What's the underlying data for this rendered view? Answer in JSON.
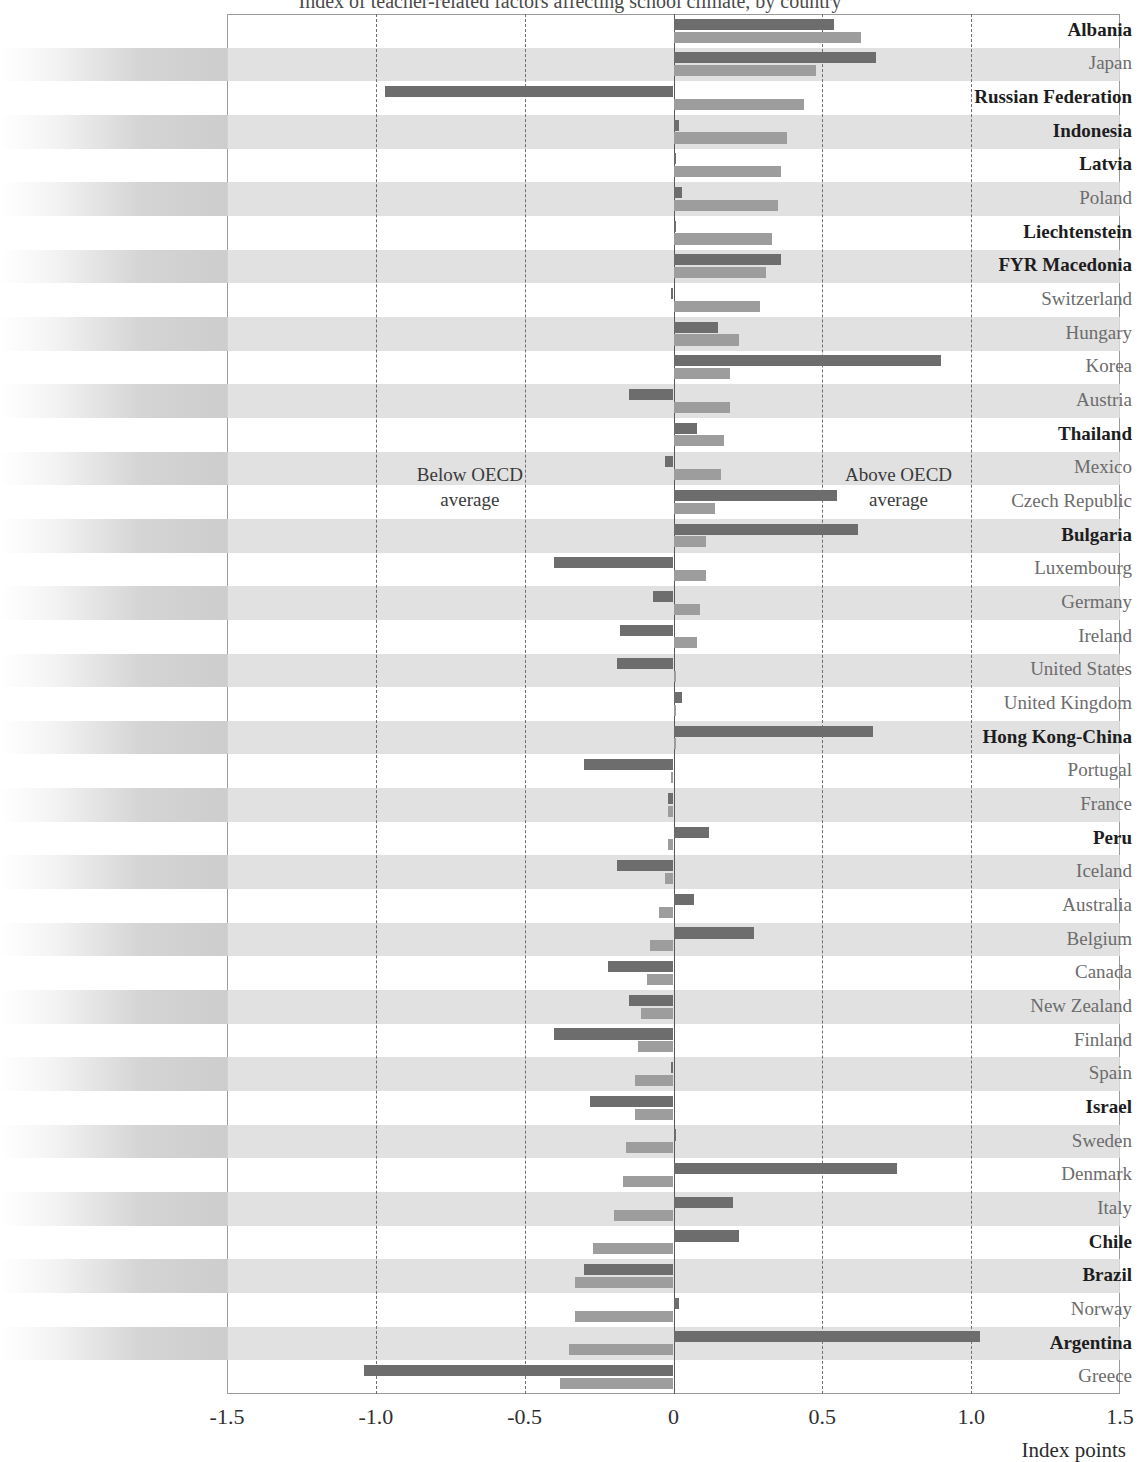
{
  "axis": {
    "label": "Index points",
    "ticks": [
      "-1.5",
      "-1.0",
      "-0.5",
      "0",
      "0.5",
      "1.0",
      "1.5"
    ],
    "min": -1.5,
    "max": 1.5
  },
  "annotations": {
    "below": "Below OECD\naverage",
    "below_line1": "Below OECD",
    "below_line2": "average",
    "above_line1": "Above OECD",
    "above_line2": "average"
  },
  "colors": {
    "series1": "#6d6d6d",
    "series2": "#9d9d9d",
    "band": "#dcdcdc",
    "gridline": "#6f6f6f",
    "zeroline": "#5a5a5a"
  },
  "chart_data": {
    "type": "bar",
    "orientation": "horizontal",
    "title": "Index of teacher-related factors affecting school climate, by country",
    "xlabel": "Index points",
    "ylabel": "",
    "xlim": [
      -1.5,
      1.5
    ],
    "xticks": [
      -1.5,
      -1.0,
      -0.5,
      0,
      0.5,
      1.0,
      1.5
    ],
    "grid": true,
    "legend_position": "none",
    "annotations": [
      "Below OECD average",
      "Above OECD average"
    ],
    "categories": [
      "Albania",
      "Japan",
      "Russian Federation",
      "Indonesia",
      "Latvia",
      "Poland",
      "Liechtenstein",
      "FYR Macedonia",
      "Switzerland",
      "Hungary",
      "Korea",
      "Austria",
      "Thailand",
      "Mexico",
      "Czech Republic",
      "Bulgaria",
      "Luxembourg",
      "Germany",
      "Ireland",
      "United States",
      "United Kingdom",
      "Hong Kong-China",
      "Portugal",
      "France",
      "Peru",
      "Iceland",
      "Australia",
      "Belgium",
      "Canada",
      "New Zealand",
      "Finland",
      "Spain",
      "Israel",
      "Sweden",
      "Denmark",
      "Italy",
      "Chile",
      "Brazil",
      "Norway",
      "Argentina",
      "Greece"
    ],
    "partner_economies": [
      "Albania",
      "Russian Federation",
      "Indonesia",
      "Latvia",
      "Liechtenstein",
      "FYR Macedonia",
      "Thailand",
      "Bulgaria",
      "Hong Kong-China",
      "Peru",
      "Israel",
      "Chile",
      "Brazil",
      "Argentina"
    ],
    "series": [
      {
        "name": "Series 1",
        "values": [
          0.54,
          0.68,
          -0.97,
          0.02,
          0.0,
          0.03,
          0.0,
          0.36,
          -0.01,
          0.15,
          0.9,
          -0.15,
          0.08,
          -0.03,
          0.55,
          0.62,
          -0.4,
          -0.07,
          -0.18,
          -0.19,
          0.03,
          0.67,
          -0.3,
          -0.02,
          0.12,
          -0.19,
          0.07,
          0.27,
          -0.22,
          -0.15,
          -0.4,
          -0.01,
          -0.28,
          0.01,
          0.75,
          0.2,
          0.22,
          -0.3,
          0.02,
          1.03,
          -1.04
        ]
      },
      {
        "name": "Series 2",
        "values": [
          0.63,
          0.48,
          0.44,
          0.38,
          0.36,
          0.35,
          0.33,
          0.31,
          0.29,
          0.22,
          0.19,
          0.19,
          0.17,
          0.16,
          0.14,
          0.11,
          0.11,
          0.09,
          0.08,
          0.0,
          0.0,
          0.0,
          -0.01,
          -0.02,
          -0.02,
          -0.03,
          -0.05,
          -0.08,
          -0.09,
          -0.11,
          -0.12,
          -0.13,
          -0.13,
          -0.16,
          -0.17,
          -0.2,
          -0.27,
          -0.33,
          -0.33,
          -0.35,
          -0.38
        ]
      }
    ]
  }
}
